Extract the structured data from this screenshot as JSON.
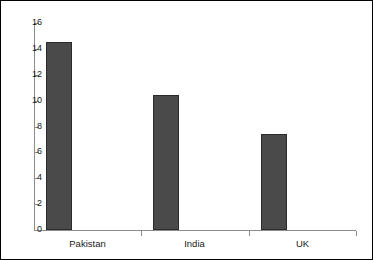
{
  "chart_data": {
    "type": "bar",
    "title": "",
    "subtitle": "",
    "xlabel": "",
    "ylabel": "",
    "categories": [
      "Pakistan",
      "India",
      "UK"
    ],
    "values": [
      14.5,
      10.4,
      7.4
    ],
    "ylim": [
      0,
      16
    ],
    "ytick_labels": [
      "16",
      "14",
      "12",
      "10",
      "8",
      "6",
      "4",
      "2",
      "0"
    ],
    "ytick_values": [
      16,
      14,
      12,
      10,
      8,
      6,
      4,
      2,
      0
    ],
    "grid": false,
    "legend": null,
    "bar_color": "#4a4a4a",
    "bar_edge_color": "#2b2b2b",
    "axis_color": "#8c8c8c",
    "border_color": "#000000",
    "background_color": "#ffffff"
  }
}
